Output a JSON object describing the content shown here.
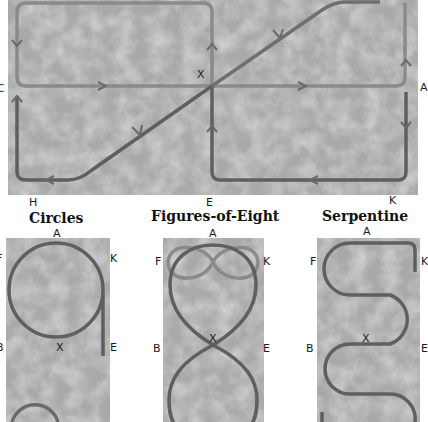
{
  "colors": {
    "panel_bg": "#a9a9a9",
    "track_dark": "#5f5f5f",
    "track_light": "#8a8a8a",
    "label": "#1a1a1a"
  },
  "top_diagram": {
    "labels": {
      "c": "C",
      "a": "A",
      "x": "X",
      "h": "H",
      "e": "E",
      "k": "K"
    }
  },
  "figures": [
    {
      "title": "Circles",
      "labels": {
        "a": "A",
        "f": "F",
        "k": "K",
        "b": "B",
        "x": "X",
        "e": "E"
      }
    },
    {
      "title": "Figures-of-Eight",
      "labels": {
        "a": "A",
        "f": "F",
        "k": "K",
        "b": "B",
        "x": "X",
        "e": "E"
      }
    },
    {
      "title": "Serpentine",
      "labels": {
        "a": "A",
        "f": "F",
        "k": "K",
        "b": "B",
        "x": "X",
        "e": "E"
      }
    }
  ]
}
